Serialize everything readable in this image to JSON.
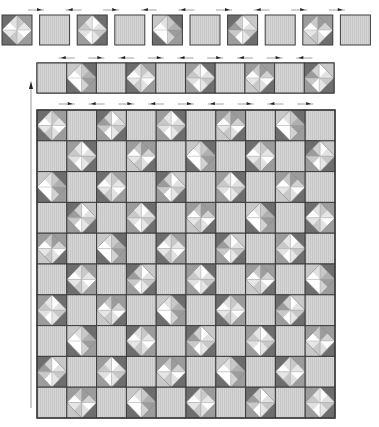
{
  "diagram": {
    "colors": {
      "plain": "#d4d4d4",
      "stripe": "#c4c4c4",
      "dark": "#6e6e6e",
      "medium": "#9c9c9c",
      "light": "#c8c8c8",
      "white": "#ffffff",
      "border": "#3c3c3c",
      "arrow": "#222222"
    },
    "top_row": {
      "blocks": [
        "qst-a",
        "plain",
        "qst-b",
        "plain",
        "qst-c",
        "plain",
        "qst-d",
        "plain",
        "qst-e",
        "plain"
      ],
      "arrows": [
        "right",
        "left",
        "right",
        "left",
        "left",
        "right",
        "left",
        "right",
        "right"
      ]
    },
    "strip": {
      "blocks": [
        "plain",
        "qst-c",
        "plain",
        "qst-a",
        "plain",
        "qst-b",
        "plain",
        "qst-e",
        "plain",
        "qst-d"
      ],
      "arrows_top": [
        "left",
        "right",
        "left",
        "right",
        "left",
        "right",
        "left",
        "right",
        "left"
      ],
      "arrows_bottom": [
        "right",
        "left",
        "right",
        "left",
        "right",
        "left",
        "right",
        "left",
        "right"
      ]
    },
    "main_grid": {
      "rows": 10,
      "cols": 10,
      "first_cell": "qst",
      "pattern": "checkerboard",
      "variants": [
        "qst-a",
        "qst-b",
        "qst-c",
        "qst-d",
        "qst-e"
      ]
    },
    "vertical_arrow": "up"
  }
}
